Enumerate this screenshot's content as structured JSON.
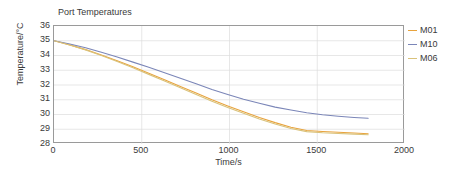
{
  "chart_data": {
    "type": "line",
    "title": "Port Temperatures",
    "xlabel": "Time/s",
    "ylabel": "Temperature/°C",
    "xlim": [
      0,
      2000
    ],
    "ylim": [
      28,
      36
    ],
    "xticks": [
      "0",
      "500",
      "1000",
      "1500",
      "2000"
    ],
    "xtick_values": [
      0,
      500,
      1000,
      1500,
      2000
    ],
    "yticks": [
      "28",
      "29",
      "30",
      "31",
      "32",
      "33",
      "34",
      "35",
      "36"
    ],
    "ytick_values": [
      28,
      29,
      30,
      31,
      32,
      33,
      34,
      35,
      36
    ],
    "grid": true,
    "legend_position": "right-outside",
    "x": [
      0,
      100,
      200,
      300,
      400,
      500,
      600,
      700,
      800,
      900,
      1000,
      1100,
      1200,
      1300,
      1400,
      1500,
      1600,
      1700,
      1800
    ],
    "series": [
      {
        "name": "M01",
        "color": "#e8a33d",
        "values": [
          35.0,
          34.62,
          34.18,
          33.69,
          33.16,
          32.61,
          32.05,
          31.49,
          30.95,
          30.42,
          29.92,
          29.45,
          29.02,
          28.63,
          28.28,
          27.98,
          27.72,
          27.5,
          27.32
        ]
      },
      {
        "name": "M10",
        "color": "#7b86b8",
        "values": [
          35.0,
          34.72,
          34.41,
          34.07,
          33.7,
          33.31,
          32.9,
          32.47,
          32.04,
          31.61,
          31.18,
          30.76,
          30.35,
          29.96,
          29.58,
          29.23,
          28.9,
          28.6,
          28.32
        ]
      },
      {
        "name": "M06",
        "color": "#d9c27a",
        "values": [
          35.0,
          34.63,
          34.2,
          33.72,
          33.2,
          32.66,
          32.11,
          31.56,
          31.02,
          30.5,
          30.0,
          29.53,
          29.09,
          28.69,
          28.33,
          28.01,
          27.73,
          27.49,
          27.28
        ]
      }
    ],
    "rendered_series": [
      {
        "name": "M01",
        "color": "#e8a33d",
        "x": [
          0,
          90,
          180,
          270,
          360,
          450,
          540,
          630,
          720,
          810,
          900,
          990,
          1080,
          1170,
          1260,
          1350,
          1440,
          1530,
          1620,
          1710,
          1790
        ],
        "values": [
          35.0,
          34.72,
          34.4,
          34.04,
          33.65,
          33.23,
          32.79,
          32.35,
          31.9,
          31.45,
          31.0,
          30.58,
          30.18,
          29.8,
          29.45,
          29.13,
          28.92,
          28.85,
          28.8,
          28.75,
          28.7
        ]
      },
      {
        "name": "M10",
        "color": "#7b86b8",
        "x": [
          0,
          90,
          180,
          270,
          360,
          450,
          540,
          630,
          720,
          810,
          900,
          990,
          1080,
          1170,
          1260,
          1350,
          1440,
          1530,
          1620,
          1710,
          1790
        ],
        "values": [
          35.0,
          34.78,
          34.52,
          34.22,
          33.9,
          33.55,
          33.2,
          32.83,
          32.46,
          32.08,
          31.7,
          31.36,
          31.04,
          30.76,
          30.5,
          30.3,
          30.12,
          29.98,
          29.88,
          29.8,
          29.75
        ]
      },
      {
        "name": "M06",
        "color": "#d9c27a",
        "x": [
          0,
          90,
          180,
          270,
          360,
          450,
          540,
          630,
          720,
          810,
          900,
          990,
          1080,
          1170,
          1260,
          1350,
          1440,
          1530,
          1620,
          1710,
          1790
        ],
        "values": [
          35.0,
          34.71,
          34.38,
          34.0,
          33.6,
          33.17,
          32.72,
          32.27,
          31.81,
          31.36,
          30.9,
          30.48,
          30.08,
          29.7,
          29.36,
          29.05,
          28.84,
          28.76,
          28.71,
          28.67,
          28.63
        ]
      }
    ]
  },
  "legend": {
    "entries": [
      {
        "label": "M01"
      },
      {
        "label": "M10"
      },
      {
        "label": "M06"
      }
    ]
  }
}
